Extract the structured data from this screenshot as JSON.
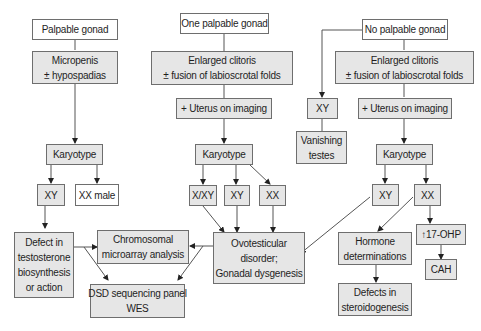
{
  "nodes": {
    "palpable_gonad": {
      "lines": [
        "Palpable gonad"
      ]
    },
    "micropenis": {
      "lines": [
        "Micropenis",
        "± hypospadias"
      ]
    },
    "karyotype_1": {
      "lines": [
        "Karyotype"
      ]
    },
    "xy_1": {
      "lines": [
        "XY"
      ]
    },
    "xx_male": {
      "lines": [
        "XX male"
      ]
    },
    "defect_testosterone": {
      "lines": [
        "Defect in",
        "testosterone",
        "biosynthesis",
        "or action"
      ]
    },
    "one_palpable_gonad": {
      "lines": [
        "One palpable gonad"
      ]
    },
    "enlarged_clitoris_1": {
      "lines": [
        "Enlarged clitoris",
        "± fusion of labioscrotal folds"
      ]
    },
    "uterus_imaging_1": {
      "lines": [
        "+ Uterus on imaging"
      ]
    },
    "karyotype_2": {
      "lines": [
        "Karyotype"
      ]
    },
    "x_xy": {
      "lines": [
        "X/XY"
      ]
    },
    "xy_2": {
      "lines": [
        "XY"
      ]
    },
    "xx_2": {
      "lines": [
        "XX"
      ]
    },
    "chromosomal_microarray": {
      "lines": [
        "Chromosomal",
        "microarray analysis"
      ]
    },
    "dsd_sequencing": {
      "lines": [
        "DSD sequencing panel",
        "WES"
      ]
    },
    "ovotesticular": {
      "lines": [
        "Ovotesticular",
        "disorder;",
        "Gonadal dysgenesis"
      ]
    },
    "no_palpable_gonad": {
      "lines": [
        "No palpable gonad"
      ]
    },
    "xy_vanishing": {
      "lines": [
        "XY"
      ]
    },
    "vanishing_testes": {
      "lines": [
        "Vanishing",
        "testes"
      ]
    },
    "enlarged_clitoris_2": {
      "lines": [
        "Enlarged clitoris",
        "± fusion of labioscrotal folds"
      ]
    },
    "uterus_imaging_2": {
      "lines": [
        "+ Uterus on imaging"
      ]
    },
    "karyotype_3": {
      "lines": [
        "Karyotype"
      ]
    },
    "xy_3": {
      "lines": [
        "XY"
      ]
    },
    "xx_3": {
      "lines": [
        "XX"
      ]
    },
    "hormone_determinations": {
      "lines": [
        "Hormone",
        "determinations"
      ]
    },
    "defects_steroidogenesis": {
      "lines": [
        "Defects in",
        "steroidogenesis"
      ]
    },
    "ohp_17": {
      "lines": [
        "↑17-OHP"
      ]
    },
    "cah": {
      "lines": [
        "CAH"
      ]
    }
  },
  "colors": {
    "box_white": "#ffffff",
    "box_grey": "#e6e6e6",
    "border": "#6e6e6e",
    "line": "#555555",
    "text": "#1e1e1e"
  }
}
